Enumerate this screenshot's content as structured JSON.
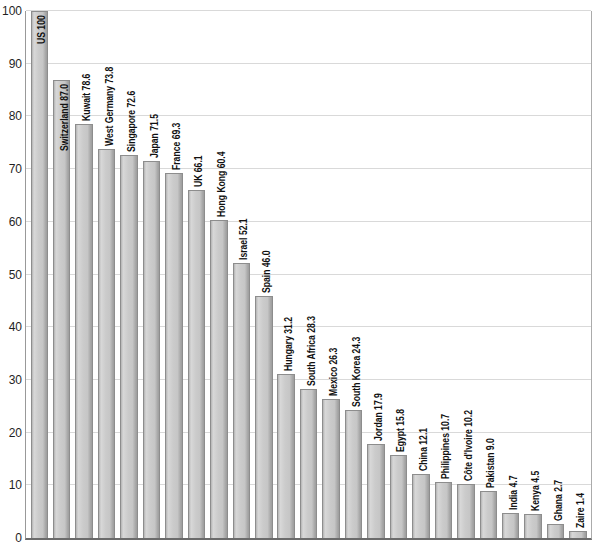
{
  "chart_data": {
    "type": "bar",
    "title": "",
    "categories": [
      "US",
      "Switzerland",
      "Kuwait",
      "West Germany",
      "Singapore",
      "Japan",
      "France",
      "UK",
      "Hong Kong",
      "Israel",
      "Spain",
      "Hungary",
      "South Africa",
      "Mexico",
      "South Korea",
      "Jordan",
      "Egypt",
      "China",
      "Philippines",
      "Côte d'Ivoire",
      "Pakistan",
      "India",
      "Kenya",
      "Ghana",
      "Zaire"
    ],
    "values": [
      100,
      87.0,
      78.6,
      73.8,
      72.6,
      71.5,
      69.3,
      66.1,
      60.4,
      52.1,
      46.0,
      31.2,
      28.3,
      26.3,
      24.3,
      17.9,
      15.8,
      12.1,
      10.7,
      10.2,
      9.0,
      4.7,
      4.5,
      2.7,
      1.4
    ],
    "display_values": [
      "100",
      "87.0",
      "78.6",
      "73.8",
      "72.6",
      "71.5",
      "69.3",
      "66.1",
      "60.4",
      "52.1",
      "46.0",
      "31.2",
      "28.3",
      "26.3",
      "24.3",
      "17.9",
      "15.8",
      "12.1",
      "10.7",
      "10.2",
      "9.0",
      "4.7",
      "4.5",
      "2.7",
      "1.4"
    ],
    "bar_label_format": "{category} {value}",
    "xlabel": "",
    "ylabel": "",
    "ylim": [
      0,
      100
    ],
    "y_ticks": [
      "0",
      "10",
      "20",
      "30",
      "40",
      "50",
      "60",
      "70",
      "80",
      "90",
      "100"
    ],
    "grid": true,
    "legend": "none",
    "colors": {
      "bar_fill": "#c6c6c6",
      "bar_fill_highlight": "#d8d8d8",
      "bar_fill_shadow": "#9d9d9d",
      "bar_border": "#8d8d8d",
      "gridline": "#d9d9d9",
      "axis_left": "#999999",
      "axis_right": "#ababab",
      "baseline": "#6b6b6b",
      "label_text": "#111111",
      "tick_text": "#1f1f1f",
      "background": "#ffffff"
    }
  }
}
